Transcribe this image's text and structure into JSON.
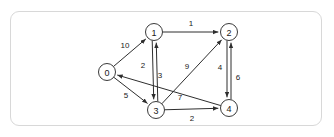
{
  "panel": {
    "border_color": "#d8d8d8",
    "background": "#ffffff"
  },
  "graph": {
    "type": "directed-weighted-graph",
    "node_radius": 8.5,
    "node_stroke": "#3a3a3a",
    "edge_stroke": "#2e2e2e",
    "nodes": [
      {
        "id": "0",
        "label": "0",
        "x": 107,
        "y": 72
      },
      {
        "id": "1",
        "label": "1",
        "x": 154,
        "y": 32
      },
      {
        "id": "2",
        "label": "2",
        "x": 229,
        "y": 32
      },
      {
        "id": "3",
        "label": "3",
        "x": 156,
        "y": 110
      },
      {
        "id": "4",
        "label": "4",
        "x": 229,
        "y": 108
      }
    ],
    "edges": [
      {
        "from": "0",
        "to": "1",
        "weight": "10",
        "label_x": 125,
        "label_y": 45
      },
      {
        "from": "1",
        "to": "2",
        "weight": "1",
        "label_x": 191,
        "label_y": 23
      },
      {
        "from": "3",
        "to": "1",
        "weight": "2",
        "label_x": 143,
        "label_y": 65
      },
      {
        "from": "1",
        "to": "3",
        "weight": "3",
        "label_x": 160,
        "label_y": 75
      },
      {
        "from": "0",
        "to": "3",
        "weight": "5",
        "label_x": 126,
        "label_y": 95
      },
      {
        "from": "3",
        "to": "4",
        "weight": "2",
        "label_x": 192,
        "label_y": 118
      },
      {
        "from": "4",
        "to": "0",
        "weight": "7",
        "label_x": 180,
        "label_y": 97
      },
      {
        "from": "3",
        "to": "2",
        "weight": "9",
        "label_x": 187,
        "label_y": 66
      },
      {
        "from": "4",
        "to": "2",
        "weight": "4",
        "label_x": 220,
        "label_y": 67
      },
      {
        "from": "2",
        "to": "4",
        "weight": "6",
        "label_x": 238,
        "label_y": 77
      }
    ]
  }
}
